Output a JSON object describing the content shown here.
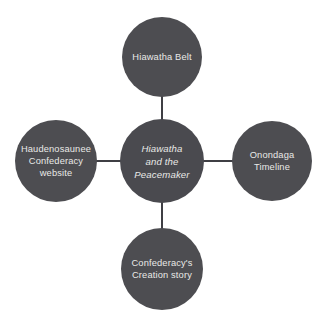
{
  "diagram": {
    "type": "hub-and-spoke concept map",
    "background_color": "#ffffff",
    "node_fill_color": "#4d4d51",
    "node_text_color": "#e9e9e7",
    "connector_color": "#3f3f44",
    "center_node": {
      "id": "center",
      "label": "Hiawatha\nand the\nPeacemaker",
      "style": "italic"
    },
    "spoke_nodes": [
      {
        "id": "top",
        "position": "top",
        "label": "Hiawatha Belt"
      },
      {
        "id": "left",
        "position": "left",
        "label": "Haudenosaunee\nConfederacy\nwebsite"
      },
      {
        "id": "right",
        "position": "right",
        "label": "Onondaga\nTimeline"
      },
      {
        "id": "bottom",
        "position": "bottom",
        "label": "Confederacy's\nCreation story"
      }
    ]
  }
}
